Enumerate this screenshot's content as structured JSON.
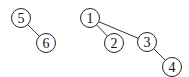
{
  "diagram": {
    "type": "graph",
    "nodes": [
      {
        "id": "5",
        "label": "5",
        "x": 21,
        "y": 18
      },
      {
        "id": "6",
        "label": "6",
        "x": 46,
        "y": 43
      },
      {
        "id": "1",
        "label": "1",
        "x": 90,
        "y": 18
      },
      {
        "id": "2",
        "label": "2",
        "x": 114,
        "y": 43
      },
      {
        "id": "3",
        "label": "3",
        "x": 147,
        "y": 42
      },
      {
        "id": "4",
        "label": "4",
        "x": 172,
        "y": 67
      }
    ],
    "edges": [
      {
        "from": "5",
        "to": "6"
      },
      {
        "from": "1",
        "to": "2"
      },
      {
        "from": "1",
        "to": "3"
      },
      {
        "from": "3",
        "to": "4"
      }
    ],
    "node_radius": 9.5
  }
}
